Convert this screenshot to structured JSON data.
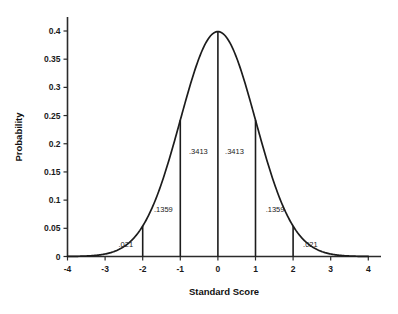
{
  "chart_data": {
    "type": "line",
    "title": "",
    "subtitle": "",
    "xlabel": "Standard Score",
    "ylabel": "Probability",
    "xlim": [
      -4,
      4
    ],
    "ylim": [
      0,
      0.4
    ],
    "grid": false,
    "legend": null,
    "x_ticks": [
      "-4",
      "-3",
      "-2",
      "-1",
      "0",
      "1",
      "2",
      "3",
      "4"
    ],
    "x_tick_values": [
      -4,
      -3,
      -2,
      -1,
      0,
      1,
      2,
      3,
      4
    ],
    "y_ticks": [
      "0",
      "0.05",
      "0.1",
      "0.15",
      "0.2",
      "0.25",
      "0.3",
      "0.35",
      "0.4"
    ],
    "y_tick_values": [
      0,
      0.05,
      0.1,
      0.15,
      0.2,
      0.25,
      0.3,
      0.35,
      0.4
    ],
    "series": [
      {
        "name": "standard normal density",
        "x": [
          -4,
          -3.75,
          -3.5,
          -3.25,
          -3,
          -2.75,
          -2.5,
          -2.25,
          -2,
          -1.75,
          -1.5,
          -1.25,
          -1,
          -0.75,
          -0.5,
          -0.25,
          0,
          0.25,
          0.5,
          0.75,
          1,
          1.25,
          1.5,
          1.75,
          2,
          2.25,
          2.5,
          2.75,
          3,
          3.25,
          3.5,
          3.75,
          4
        ],
        "y": [
          0.0001,
          0.0004,
          0.0009,
          0.002,
          0.0044,
          0.0091,
          0.0175,
          0.0317,
          0.054,
          0.0863,
          0.1295,
          0.1826,
          0.242,
          0.3011,
          0.3521,
          0.3867,
          0.3989,
          0.3867,
          0.3521,
          0.3011,
          0.242,
          0.1826,
          0.1295,
          0.0863,
          0.054,
          0.0317,
          0.0175,
          0.0091,
          0.0044,
          0.002,
          0.0009,
          0.0004,
          0.0001
        ]
      }
    ],
    "dividers": [
      -2,
      -1,
      0,
      1,
      2
    ],
    "area_labels": [
      {
        "id": "area-neg-2-sigma",
        "text": ".021",
        "x": -2.45,
        "y": 0.016
      },
      {
        "id": "area-neg-1-sigma",
        "text": ".1359",
        "x": -1.45,
        "y": 0.079
      },
      {
        "id": "area-neg-center",
        "text": ".3413",
        "x": -0.52,
        "y": 0.182
      },
      {
        "id": "area-pos-center",
        "text": ".3413",
        "x": 0.44,
        "y": 0.182
      },
      {
        "id": "area-pos-1-sigma",
        "text": ".1359",
        "x": 1.52,
        "y": 0.079
      },
      {
        "id": "area-pos-2-sigma",
        "text": ".021",
        "x": 2.46,
        "y": 0.016
      }
    ],
    "colors": {
      "background": "#ffffff",
      "curve": "#1c1c1c",
      "axis": "#2b2b2b",
      "text": "#1a1a1a"
    }
  }
}
